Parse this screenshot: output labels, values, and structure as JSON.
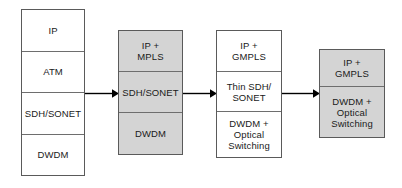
{
  "diagram": {
    "colors": {
      "white_fill": "#ffffff",
      "gray_fill": "#d4d4d4",
      "border": "#5a5a5a",
      "text": "#1a1a1a",
      "arrow": "#000000"
    },
    "stacks": [
      {
        "id": "stack-1",
        "fill": "white",
        "layers": [
          {
            "label": "IP"
          },
          {
            "label": "ATM"
          },
          {
            "label": "SDH/SONET"
          },
          {
            "label": "DWDM"
          }
        ]
      },
      {
        "id": "stack-2",
        "fill": "gray",
        "layers": [
          {
            "label": "IP +\nMPLS"
          },
          {
            "label": "SDH/SONET"
          },
          {
            "label": "DWDM"
          }
        ]
      },
      {
        "id": "stack-3",
        "fill": "white",
        "layers": [
          {
            "label": "IP +\nGMPLS"
          },
          {
            "label": "Thin SDH/\nSONET"
          },
          {
            "label": "DWDM +\nOptical\nSwitching"
          }
        ]
      },
      {
        "id": "stack-4",
        "fill": "gray",
        "layers": [
          {
            "label": "IP +\nGMPLS"
          },
          {
            "label": "DWDM +\nOptical\nSwitching"
          }
        ]
      }
    ],
    "arrows": [
      {
        "id": "arrow-1",
        "name": "arrow-stack1-to-stack2"
      },
      {
        "id": "arrow-2",
        "name": "arrow-stack2-to-stack3"
      },
      {
        "id": "arrow-3",
        "name": "arrow-stack3-to-stack4"
      }
    ]
  }
}
